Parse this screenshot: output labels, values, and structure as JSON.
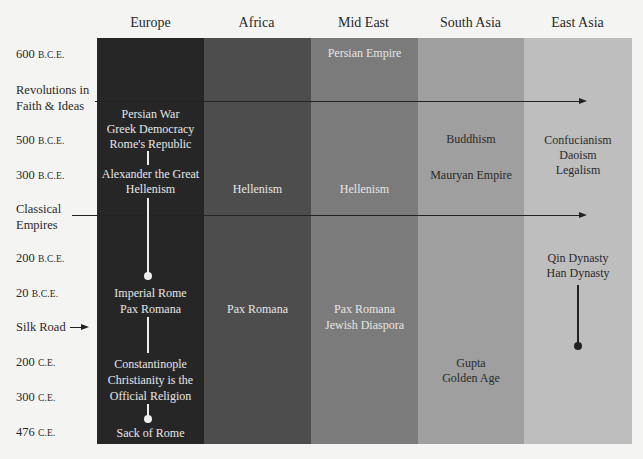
{
  "columns": [
    {
      "label": "Europe",
      "color": "#262626"
    },
    {
      "label": "Africa",
      "color": "#4d4d4d"
    },
    {
      "label": "Mid East",
      "color": "#7b7b7b"
    },
    {
      "label": "South Asia",
      "color": "#9f9f9f"
    },
    {
      "label": "East Asia",
      "color": "#bebebe"
    }
  ],
  "rows": [
    {
      "num": "600",
      "era": "B.C.E."
    },
    {
      "text1": "Revolutions in",
      "text2": "Faith & Ideas"
    },
    {
      "num": "500",
      "era": "B.C.E."
    },
    {
      "num": "300",
      "era": "B.C.E."
    },
    {
      "text1": "Classical",
      "text2": "Empires"
    },
    {
      "num": "200",
      "era": "B.C.E."
    },
    {
      "num": "20",
      "era": "B.C.E."
    },
    {
      "text1": "Silk Road"
    },
    {
      "num": "200",
      "era": "C.E."
    },
    {
      "num": "300",
      "era": "C.E."
    },
    {
      "num": "476",
      "era": "C.E."
    }
  ],
  "cells": {
    "europe": {
      "persian_war": "Persian War",
      "greek_democracy": "Greek Democracy",
      "romes_republic": "Rome's Republic",
      "alexander": "Alexander the Great",
      "hellenism": "Hellenism",
      "imperial_rome": "Imperial Rome",
      "pax_romana": "Pax Romana",
      "constantinople": "Constantinople",
      "christianity": "Christianity is the",
      "official_religion": "Official Religion",
      "sack_of_rome": "Sack of Rome"
    },
    "africa": {
      "hellenism": "Hellenism",
      "pax_romana": "Pax Romana"
    },
    "mid_east": {
      "persian_empire": "Persian Empire",
      "hellenism": "Hellenism",
      "pax_romana": "Pax Romana",
      "jewish_diaspora": "Jewish Diaspora"
    },
    "south_asia": {
      "buddhism": "Buddhism",
      "mauryan_empire": "Mauryan Empire",
      "gupta": "Gupta",
      "golden_age": "Golden Age"
    },
    "east_asia": {
      "confucianism": "Confucianism",
      "daoism": "Daoism",
      "legalism": "Legalism",
      "qin_dynasty": "Qin Dynasty",
      "han_dynasty": "Han Dynasty"
    }
  }
}
